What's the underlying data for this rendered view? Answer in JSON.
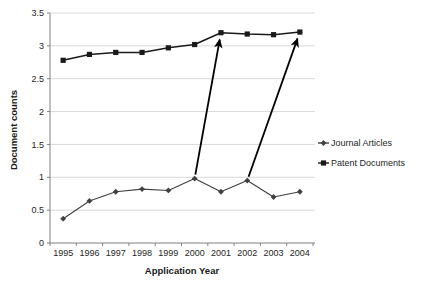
{
  "chart_data": {
    "type": "line",
    "title": "",
    "xlabel": "Application Year",
    "ylabel": "Document counts",
    "categories": [
      "1995",
      "1996",
      "1997",
      "1998",
      "1999",
      "2000",
      "2001",
      "2002",
      "2003",
      "2004"
    ],
    "x": [
      1995,
      1996,
      1997,
      1998,
      1999,
      2000,
      2001,
      2002,
      2003,
      2004
    ],
    "ylim": [
      0,
      3.5
    ],
    "ytick_labels": [
      "0",
      "0.5",
      "1",
      "1.5",
      "2",
      "2.5",
      "3",
      "3.5"
    ],
    "yticks": [
      0,
      0.5,
      1,
      1.5,
      2,
      2.5,
      3,
      3.5
    ],
    "grid": "horizontal",
    "grid_color": "#d9d9d9",
    "legend_position": "right",
    "series": [
      {
        "name": "Journal Articles",
        "marker": "diamond",
        "color": "#404040",
        "values": [
          0.37,
          0.64,
          0.78,
          0.82,
          0.8,
          0.98,
          0.78,
          0.95,
          0.7,
          0.78
        ]
      },
      {
        "name": "Patent Documents",
        "marker": "square",
        "color": "#1a1a1a",
        "values": [
          2.78,
          2.87,
          2.9,
          2.9,
          2.97,
          3.02,
          3.2,
          3.18,
          3.17,
          3.21
        ]
      }
    ],
    "annotations": [
      {
        "type": "arrow",
        "label": "arrow-2000-journal-to-2001-patent",
        "from": {
          "x": 2000,
          "y": 0.98
        },
        "to": {
          "x": 2001,
          "y": 3.2
        },
        "color": "#000000"
      },
      {
        "type": "arrow",
        "label": "arrow-2002-journal-to-2004-patent",
        "from": {
          "x": 2002,
          "y": 0.95
        },
        "to": {
          "x": 2004,
          "y": 3.21
        },
        "color": "#000000"
      }
    ]
  },
  "legend": {
    "items": [
      {
        "label": "Journal Articles"
      },
      {
        "label": "Patent Documents"
      }
    ]
  },
  "axes": {
    "x_title": "Application Year",
    "y_title": "Document counts"
  }
}
